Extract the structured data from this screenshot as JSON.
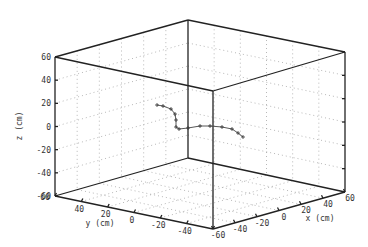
{
  "chart_data": {
    "type": "scatter",
    "subtype": "3d-line",
    "title": "",
    "xlabel": "x (cm)",
    "ylabel": "y (cm)",
    "zlabel": "z (cm)",
    "xlim": [
      -60,
      60
    ],
    "ylim": [
      -60,
      60
    ],
    "zlim": [
      -60,
      60
    ],
    "x_ticks": [
      "-60",
      "-40",
      "-20",
      "0",
      "20",
      "40",
      "60"
    ],
    "y_ticks": [
      "60",
      "40",
      "20",
      "0",
      "-20",
      "-40",
      "-60"
    ],
    "z_ticks": [
      "60",
      "40",
      "20",
      "0",
      "-20",
      "-40",
      "-60"
    ],
    "grid": true,
    "legend": null,
    "series": [
      {
        "name": "trajectory",
        "marker": "+",
        "screen_points": [
          [
            157,
            105
          ],
          [
            163,
            106
          ],
          [
            171,
            109
          ],
          [
            175,
            114
          ],
          [
            176,
            120
          ],
          [
            176,
            127
          ],
          [
            179,
            129
          ],
          [
            188,
            128
          ],
          [
            200,
            126
          ],
          [
            210,
            126
          ],
          [
            222,
            127
          ],
          [
            232,
            129
          ],
          [
            238,
            133
          ],
          [
            243,
            137
          ]
        ]
      }
    ]
  },
  "axes": {
    "x_label": "x (cm)",
    "y_label": "y (cm)",
    "z_label": "z (cm)",
    "z_tick_labels": [
      "60",
      "40",
      "20",
      "0",
      "-20",
      "-40",
      "-60"
    ],
    "y_tick_labels": [
      "60",
      "40",
      "20",
      "0",
      "-20",
      "-40",
      "-60"
    ],
    "x_tick_labels": [
      "-60",
      "-40",
      "-20",
      "0",
      "20",
      "40",
      "60"
    ]
  }
}
